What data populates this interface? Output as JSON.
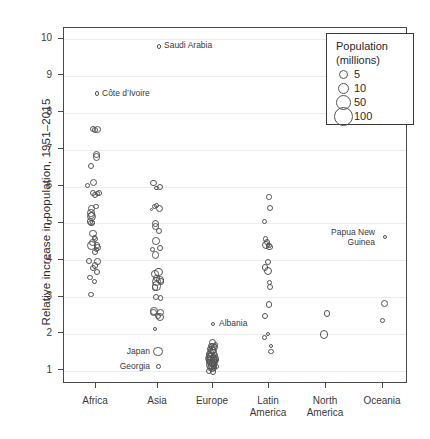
{
  "chart_data": {
    "type": "scatter",
    "title": "",
    "xlabel": "",
    "ylabel": "Relative increase in population, 1951–2015",
    "categories": [
      "Africa",
      "Asia",
      "Europe",
      "Latin America",
      "North America",
      "Oceania"
    ],
    "ylim": [
      0.6,
      10.3
    ],
    "yticks": [
      1,
      2,
      3,
      4,
      5,
      6,
      7,
      8,
      9,
      10
    ],
    "grid": "horizontal",
    "size_encoding": "Population (millions)",
    "legend": {
      "title_line1": "Population",
      "title_line2": "(millions)",
      "position": "top-right",
      "entries": [
        {
          "label": "5",
          "value": 5,
          "px": 4.5
        },
        {
          "label": "10",
          "value": 10,
          "px": 5.5
        },
        {
          "label": "50",
          "value": 50,
          "px": 7.5
        },
        {
          "label": "100",
          "value": 100,
          "px": 9.5
        }
      ]
    },
    "annotations": [
      {
        "text": "Saudi Arabia",
        "category": "Asia",
        "y": 9.8,
        "anchor": "left"
      },
      {
        "text": "Côte d’Ivoire",
        "category": "Africa",
        "y": 8.52,
        "anchor": "left"
      },
      {
        "text": "Albania",
        "category": "Europe",
        "y": 2.27,
        "anchor": "left"
      },
      {
        "text": "Japan",
        "category": "Asia",
        "y": 1.52,
        "anchor": "right"
      },
      {
        "text": "Georgia",
        "category": "Asia",
        "y": 1.11,
        "anchor": "right"
      },
      {
        "text": "Papua New\nGuinea",
        "category": "Oceania",
        "y": 4.62,
        "anchor": "right"
      }
    ],
    "series": [
      {
        "name": "Africa",
        "points": [
          {
            "x": 0.02,
            "y": 8.52,
            "r": 2.3
          },
          {
            "x": -0.07,
            "y": 7.55,
            "r": 3.2
          },
          {
            "x": -0.02,
            "y": 7.54,
            "r": 3.0
          },
          {
            "x": 0.04,
            "y": 7.55,
            "r": 3.4
          },
          {
            "x": 0.01,
            "y": 6.88,
            "r": 3.5
          },
          {
            "x": 0.01,
            "y": 6.8,
            "r": 3.6
          },
          {
            "x": -0.12,
            "y": 6.55,
            "r": 3.0
          },
          {
            "x": -0.18,
            "y": 6.02,
            "r": 2.8
          },
          {
            "x": -0.05,
            "y": 6.1,
            "r": 3.6
          },
          {
            "x": -0.07,
            "y": 5.82,
            "r": 3.2
          },
          {
            "x": -0.02,
            "y": 5.78,
            "r": 3.0
          },
          {
            "x": 0.03,
            "y": 5.8,
            "r": 2.4
          },
          {
            "x": 0.06,
            "y": 5.82,
            "r": 3.0
          },
          {
            "x": 0.0,
            "y": 5.45,
            "r": 2.6
          },
          {
            "x": -0.1,
            "y": 5.4,
            "r": 3.4
          },
          {
            "x": -0.11,
            "y": 5.28,
            "r": 3.8
          },
          {
            "x": -0.1,
            "y": 5.22,
            "r": 3.6
          },
          {
            "x": -0.09,
            "y": 5.18,
            "r": 4.6
          },
          {
            "x": -0.13,
            "y": 5.05,
            "r": 3.2
          },
          {
            "x": -0.1,
            "y": 5.0,
            "r": 3.2
          },
          {
            "x": -0.07,
            "y": 5.02,
            "r": 2.6
          },
          {
            "x": -0.06,
            "y": 4.72,
            "r": 3.8
          },
          {
            "x": -0.08,
            "y": 4.48,
            "r": 3.8
          },
          {
            "x": -0.09,
            "y": 4.4,
            "r": 4.6
          },
          {
            "x": -0.02,
            "y": 4.58,
            "r": 3.0
          },
          {
            "x": -0.03,
            "y": 4.62,
            "r": 2.8
          },
          {
            "x": 0.02,
            "y": 4.4,
            "r": 3.4
          },
          {
            "x": 0.03,
            "y": 4.35,
            "r": 3.8
          },
          {
            "x": -0.02,
            "y": 4.22,
            "r": 3.0
          },
          {
            "x": 0.01,
            "y": 4.3,
            "r": 2.6
          },
          {
            "x": -0.15,
            "y": 3.98,
            "r": 3.4
          },
          {
            "x": -0.06,
            "y": 3.8,
            "r": 3.0
          },
          {
            "x": -0.02,
            "y": 3.85,
            "r": 3.4
          },
          {
            "x": 0.03,
            "y": 3.96,
            "r": 3.2
          },
          {
            "x": -0.13,
            "y": 3.52,
            "r": 2.6
          },
          {
            "x": -0.04,
            "y": 3.42,
            "r": 2.6
          },
          {
            "x": 0.02,
            "y": 3.68,
            "r": 3.0
          },
          {
            "x": -0.11,
            "y": 3.07,
            "r": 2.8
          }
        ]
      },
      {
        "name": "Asia",
        "points": [
          {
            "x": 0.02,
            "y": 9.8,
            "r": 2.4
          },
          {
            "x": -0.1,
            "y": 6.1,
            "r": 3.2
          },
          {
            "x": -0.03,
            "y": 5.96,
            "r": 2.4
          },
          {
            "x": 0.05,
            "y": 6.0,
            "r": 3.0
          },
          {
            "x": -0.14,
            "y": 5.38,
            "r": 1.4
          },
          {
            "x": -0.07,
            "y": 5.45,
            "r": 2.6
          },
          {
            "x": -0.03,
            "y": 5.48,
            "r": 2.8
          },
          {
            "x": 0.04,
            "y": 5.4,
            "r": 3.6
          },
          {
            "x": -0.05,
            "y": 5.0,
            "r": 3.8
          },
          {
            "x": -0.05,
            "y": 4.92,
            "r": 3.8
          },
          {
            "x": 0.02,
            "y": 4.8,
            "r": 3.0
          },
          {
            "x": -0.11,
            "y": 4.3,
            "r": 2.6
          },
          {
            "x": -0.04,
            "y": 4.52,
            "r": 3.8
          },
          {
            "x": -0.06,
            "y": 4.14,
            "r": 3.6
          },
          {
            "x": 0.05,
            "y": 4.32,
            "r": 3.0
          },
          {
            "x": -0.06,
            "y": 3.62,
            "r": 3.8
          },
          {
            "x": -0.04,
            "y": 3.52,
            "r": 3.4
          },
          {
            "x": -0.04,
            "y": 3.42,
            "r": 4.6
          },
          {
            "x": -0.03,
            "y": 3.3,
            "r": 4.8
          },
          {
            "x": -0.06,
            "y": 3.26,
            "r": 3.2
          },
          {
            "x": 0.01,
            "y": 3.68,
            "r": 4.2
          },
          {
            "x": 0.04,
            "y": 3.46,
            "r": 3.8
          },
          {
            "x": 0.06,
            "y": 3.42,
            "r": 3.2
          },
          {
            "x": -0.05,
            "y": 3.0,
            "r": 3.2
          },
          {
            "x": 0.05,
            "y": 2.98,
            "r": 2.8
          },
          {
            "x": -0.09,
            "y": 2.62,
            "r": 3.8
          },
          {
            "x": -0.09,
            "y": 2.58,
            "r": 3.6
          },
          {
            "x": 0.0,
            "y": 2.48,
            "r": 3.0
          },
          {
            "x": 0.04,
            "y": 2.45,
            "r": 4.2
          },
          {
            "x": 0.06,
            "y": 2.58,
            "r": 3.4
          },
          {
            "x": -0.07,
            "y": 2.13,
            "r": 2.0
          },
          {
            "x": 0.0,
            "y": 1.52,
            "r": 4.6
          },
          {
            "x": 0.01,
            "y": 1.11,
            "r": 2.6
          }
        ]
      },
      {
        "name": "Europe",
        "points": [
          {
            "x": 0.0,
            "y": 2.27,
            "r": 2.0
          },
          {
            "x": 0.06,
            "y": 1.72,
            "r": 2.6
          },
          {
            "x": -0.01,
            "y": 1.76,
            "r": 3.4
          },
          {
            "x": -0.04,
            "y": 1.68,
            "r": 3.0
          },
          {
            "x": 0.0,
            "y": 1.66,
            "r": 3.8
          },
          {
            "x": 0.03,
            "y": 1.64,
            "r": 3.4
          },
          {
            "x": -0.07,
            "y": 1.6,
            "r": 3.0
          },
          {
            "x": -0.02,
            "y": 1.56,
            "r": 4.2
          },
          {
            "x": 0.02,
            "y": 1.54,
            "r": 3.6
          },
          {
            "x": -0.05,
            "y": 1.48,
            "r": 3.8
          },
          {
            "x": -0.09,
            "y": 1.44,
            "r": 3.2
          },
          {
            "x": -0.01,
            "y": 1.46,
            "r": 4.6
          },
          {
            "x": 0.04,
            "y": 1.44,
            "r": 3.0
          },
          {
            "x": -0.07,
            "y": 1.38,
            "r": 4.2
          },
          {
            "x": -0.03,
            "y": 1.38,
            "r": 4.8
          },
          {
            "x": 0.01,
            "y": 1.36,
            "r": 3.8
          },
          {
            "x": 0.05,
            "y": 1.34,
            "r": 3.4
          },
          {
            "x": -0.1,
            "y": 1.34,
            "r": 3.6
          },
          {
            "x": -0.06,
            "y": 1.3,
            "r": 4.2
          },
          {
            "x": -0.02,
            "y": 1.28,
            "r": 5.2
          },
          {
            "x": 0.02,
            "y": 1.28,
            "r": 4.0
          },
          {
            "x": 0.06,
            "y": 1.3,
            "r": 3.0
          },
          {
            "x": -0.09,
            "y": 1.24,
            "r": 3.2
          },
          {
            "x": -0.04,
            "y": 1.22,
            "r": 4.4
          },
          {
            "x": 0.0,
            "y": 1.2,
            "r": 3.8
          },
          {
            "x": 0.04,
            "y": 1.22,
            "r": 3.4
          },
          {
            "x": -0.07,
            "y": 1.16,
            "r": 3.8
          },
          {
            "x": -0.02,
            "y": 1.14,
            "r": 4.2
          },
          {
            "x": 0.02,
            "y": 1.14,
            "r": 3.2
          },
          {
            "x": 0.06,
            "y": 1.12,
            "r": 2.8
          },
          {
            "x": -0.05,
            "y": 1.08,
            "r": 3.4
          },
          {
            "x": -0.01,
            "y": 1.06,
            "r": 3.8
          },
          {
            "x": 0.03,
            "y": 1.08,
            "r": 3.0
          },
          {
            "x": -0.08,
            "y": 1.0,
            "r": 3.0
          },
          {
            "x": 0.0,
            "y": 0.98,
            "r": 3.4
          }
        ]
      },
      {
        "name": "Latin America",
        "points": [
          {
            "x": 0.0,
            "y": 5.72,
            "r": 2.8
          },
          {
            "x": 0.03,
            "y": 5.42,
            "r": 3.0
          },
          {
            "x": -0.09,
            "y": 5.05,
            "r": 2.6
          },
          {
            "x": -0.08,
            "y": 4.58,
            "r": 2.8
          },
          {
            "x": -0.05,
            "y": 4.5,
            "r": 3.0
          },
          {
            "x": -0.07,
            "y": 4.4,
            "r": 4.0
          },
          {
            "x": -0.02,
            "y": 4.42,
            "r": 2.2
          },
          {
            "x": 0.01,
            "y": 4.35,
            "r": 3.2
          },
          {
            "x": 0.0,
            "y": 4.4,
            "r": 2.8
          },
          {
            "x": -0.09,
            "y": 3.8,
            "r": 3.2
          },
          {
            "x": -0.02,
            "y": 3.96,
            "r": 3.0
          },
          {
            "x": -0.02,
            "y": 3.7,
            "r": 4.0
          },
          {
            "x": 0.01,
            "y": 3.4,
            "r": 2.4
          },
          {
            "x": 0.01,
            "y": 3.28,
            "r": 3.0
          },
          {
            "x": 0.0,
            "y": 2.8,
            "r": 3.4
          },
          {
            "x": -0.09,
            "y": 2.48,
            "r": 3.2
          },
          {
            "x": -0.1,
            "y": 1.9,
            "r": 2.4
          },
          {
            "x": -0.02,
            "y": 2.0,
            "r": 2.4
          },
          {
            "x": 0.04,
            "y": 1.68,
            "r": 2.2
          },
          {
            "x": 0.04,
            "y": 1.52,
            "r": 2.8
          }
        ]
      },
      {
        "name": "North America",
        "points": [
          {
            "x": 0.02,
            "y": 2.55,
            "r": 3.2
          },
          {
            "x": -0.04,
            "y": 1.98,
            "r": 4.2
          }
        ]
      },
      {
        "name": "Oceania",
        "points": [
          {
            "x": 0.05,
            "y": 4.62,
            "r": 2.2
          },
          {
            "x": 0.04,
            "y": 2.82,
            "r": 3.4
          },
          {
            "x": -0.01,
            "y": 2.36,
            "r": 2.4
          }
        ]
      }
    ]
  }
}
